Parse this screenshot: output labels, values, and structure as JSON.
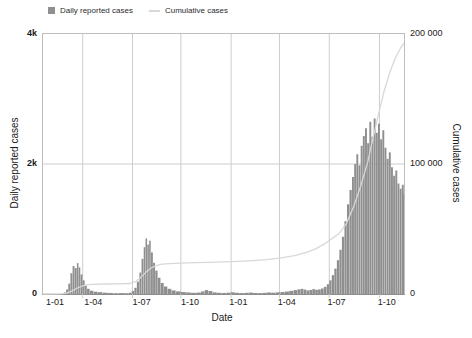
{
  "legend": {
    "daily_label": "Daily reported cases",
    "cumulative_label": "Cumulative cases"
  },
  "axes": {
    "left_title": "Daily reported cases",
    "right_title": "Cumulative cases",
    "x_title": "Date",
    "left_ticks": [
      {
        "label": "4k",
        "frac": 0
      },
      {
        "label": "2k",
        "frac": 0.5
      },
      {
        "label": "0",
        "frac": 1
      }
    ],
    "right_ticks": [
      {
        "label": "200 000",
        "frac": 0
      },
      {
        "label": "100 000",
        "frac": 0.5
      },
      {
        "label": "0",
        "frac": 1
      }
    ],
    "x_ticks": [
      {
        "label": "1-01",
        "frac": 0.036
      },
      {
        "label": "1-04",
        "frac": 0.142
      },
      {
        "label": "1-07",
        "frac": 0.276
      },
      {
        "label": "1-10",
        "frac": 0.41
      },
      {
        "label": "1-01",
        "frac": 0.544
      },
      {
        "label": "1-04",
        "frac": 0.678
      },
      {
        "label": "1-07",
        "frac": 0.816
      },
      {
        "label": "1-10",
        "frac": 0.955
      }
    ]
  },
  "colors": {
    "bar": "#8f8f8f",
    "line": "#d8d8d8",
    "grid": "#cdcdcd",
    "axis": "#9a9a9a",
    "text": "#1a1a1a"
  },
  "chart_data": {
    "type": "bar",
    "title": "",
    "xlabel": "Date",
    "ylabel_left": "Daily reported cases",
    "ylabel_right": "Cumulative cases",
    "grid": true,
    "legend_position": "top",
    "x_axis": {
      "note": "x values are fractions of the two-year axis; tick labels are month-day (1-01, 1-04, 1-07, 1-10) repeated for two years",
      "labels": [
        "1-01",
        "1-04",
        "1-07",
        "1-10",
        "1-01",
        "1-04",
        "1-07",
        "1-10"
      ],
      "gridline_fracs": [
        0.11,
        0.248,
        0.382,
        0.521,
        0.655,
        0.793,
        0.932
      ]
    },
    "y_left": {
      "range": [
        0,
        4000
      ],
      "ticks": [
        "0",
        "2k",
        "4k"
      ]
    },
    "y_right": {
      "range": [
        0,
        200000
      ],
      "ticks": [
        "0",
        "100 000",
        "200 000"
      ]
    },
    "series": [
      {
        "name": "Daily reported cases",
        "type": "bar",
        "axis": "left",
        "points": [
          [
            0.05,
            0
          ],
          [
            0.058,
            25
          ],
          [
            0.064,
            70
          ],
          [
            0.07,
            160
          ],
          [
            0.076,
            320
          ],
          [
            0.082,
            430
          ],
          [
            0.088,
            400
          ],
          [
            0.094,
            475
          ],
          [
            0.099,
            410
          ],
          [
            0.104,
            300
          ],
          [
            0.11,
            210
          ],
          [
            0.116,
            130
          ],
          [
            0.122,
            80
          ],
          [
            0.13,
            50
          ],
          [
            0.14,
            35
          ],
          [
            0.152,
            28
          ],
          [
            0.165,
            20
          ],
          [
            0.18,
            15
          ],
          [
            0.195,
            12
          ],
          [
            0.21,
            14
          ],
          [
            0.225,
            12
          ],
          [
            0.238,
            20
          ],
          [
            0.246,
            45
          ],
          [
            0.253,
            95
          ],
          [
            0.26,
            190
          ],
          [
            0.267,
            330
          ],
          [
            0.273,
            540
          ],
          [
            0.279,
            720
          ],
          [
            0.284,
            855
          ],
          [
            0.289,
            760
          ],
          [
            0.294,
            820
          ],
          [
            0.299,
            640
          ],
          [
            0.305,
            480
          ],
          [
            0.311,
            360
          ],
          [
            0.318,
            250
          ],
          [
            0.326,
            170
          ],
          [
            0.335,
            115
          ],
          [
            0.345,
            80
          ],
          [
            0.356,
            55
          ],
          [
            0.368,
            40
          ],
          [
            0.382,
            30
          ],
          [
            0.396,
            24
          ],
          [
            0.41,
            18
          ],
          [
            0.425,
            22
          ],
          [
            0.438,
            40
          ],
          [
            0.448,
            60
          ],
          [
            0.458,
            45
          ],
          [
            0.47,
            25
          ],
          [
            0.482,
            18
          ],
          [
            0.495,
            15
          ],
          [
            0.508,
            20
          ],
          [
            0.52,
            26
          ],
          [
            0.532,
            18
          ],
          [
            0.545,
            14
          ],
          [
            0.558,
            18
          ],
          [
            0.57,
            22
          ],
          [
            0.582,
            16
          ],
          [
            0.595,
            14
          ],
          [
            0.608,
            18
          ],
          [
            0.62,
            24
          ],
          [
            0.632,
            20
          ],
          [
            0.645,
            25
          ],
          [
            0.658,
            30
          ],
          [
            0.67,
            38
          ],
          [
            0.682,
            48
          ],
          [
            0.694,
            60
          ],
          [
            0.705,
            72
          ],
          [
            0.714,
            80
          ],
          [
            0.722,
            68
          ],
          [
            0.73,
            55
          ],
          [
            0.738,
            62
          ],
          [
            0.746,
            75
          ],
          [
            0.754,
            65
          ],
          [
            0.762,
            70
          ],
          [
            0.77,
            85
          ],
          [
            0.778,
            110
          ],
          [
            0.786,
            150
          ],
          [
            0.793,
            210
          ],
          [
            0.8,
            290
          ],
          [
            0.807,
            390
          ],
          [
            0.814,
            520
          ],
          [
            0.821,
            680
          ],
          [
            0.828,
            880
          ],
          [
            0.835,
            1120
          ],
          [
            0.842,
            1380
          ],
          [
            0.849,
            1600
          ],
          [
            0.856,
            1800
          ],
          [
            0.862,
            2000
          ],
          [
            0.868,
            2150
          ],
          [
            0.874,
            1980
          ],
          [
            0.88,
            2280
          ],
          [
            0.886,
            2430
          ],
          [
            0.892,
            2550
          ],
          [
            0.898,
            2320
          ],
          [
            0.904,
            2650
          ],
          [
            0.91,
            2420
          ],
          [
            0.916,
            2700
          ],
          [
            0.922,
            2480
          ],
          [
            0.928,
            2620
          ],
          [
            0.934,
            2380
          ],
          [
            0.94,
            2520
          ],
          [
            0.946,
            2250
          ],
          [
            0.952,
            2080
          ],
          [
            0.958,
            2180
          ],
          [
            0.964,
            1950
          ],
          [
            0.97,
            1820
          ],
          [
            0.976,
            1900
          ],
          [
            0.982,
            1700
          ],
          [
            0.988,
            1620
          ],
          [
            0.994,
            1680
          ],
          [
            1.0,
            1540
          ]
        ]
      },
      {
        "name": "Cumulative cases",
        "type": "line",
        "axis": "right",
        "points": [
          [
            0,
            0
          ],
          [
            0.05,
            100
          ],
          [
            0.065,
            600
          ],
          [
            0.08,
            2200
          ],
          [
            0.095,
            4600
          ],
          [
            0.11,
            6300
          ],
          [
            0.125,
            7200
          ],
          [
            0.14,
            7500
          ],
          [
            0.17,
            7700
          ],
          [
            0.2,
            7800
          ],
          [
            0.24,
            8100
          ],
          [
            0.258,
            9800
          ],
          [
            0.272,
            13000
          ],
          [
            0.286,
            17000
          ],
          [
            0.3,
            20200
          ],
          [
            0.315,
            22000
          ],
          [
            0.33,
            22900
          ],
          [
            0.35,
            23400
          ],
          [
            0.38,
            23800
          ],
          [
            0.42,
            24100
          ],
          [
            0.46,
            24400
          ],
          [
            0.5,
            24700
          ],
          [
            0.54,
            25100
          ],
          [
            0.58,
            25700
          ],
          [
            0.62,
            26500
          ],
          [
            0.66,
            27800
          ],
          [
            0.7,
            29800
          ],
          [
            0.73,
            32000
          ],
          [
            0.755,
            34800
          ],
          [
            0.78,
            38500
          ],
          [
            0.8,
            42500
          ],
          [
            0.82,
            46500
          ],
          [
            0.84,
            54000
          ],
          [
            0.86,
            67000
          ],
          [
            0.88,
            83000
          ],
          [
            0.9,
            102000
          ],
          [
            0.915,
            121000
          ],
          [
            0.93,
            139000
          ],
          [
            0.945,
            156000
          ],
          [
            0.96,
            170000
          ],
          [
            0.975,
            181000
          ],
          [
            0.99,
            189000
          ],
          [
            1.0,
            193000
          ]
        ]
      }
    ]
  }
}
